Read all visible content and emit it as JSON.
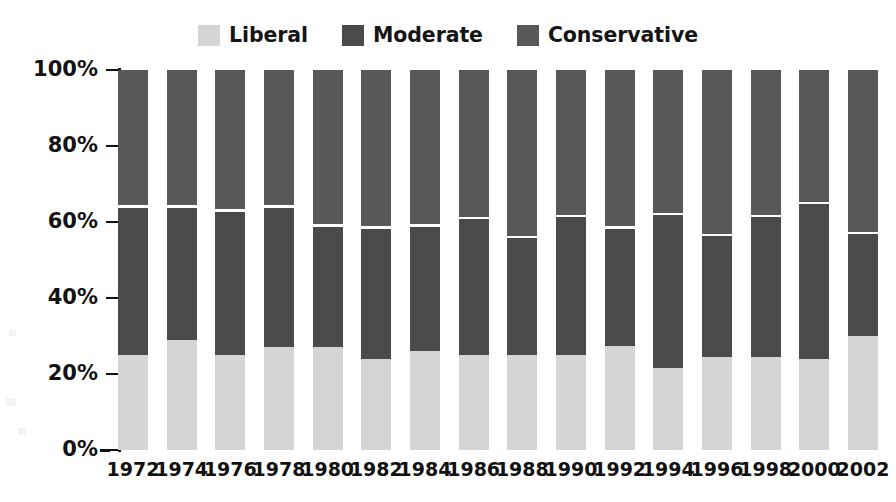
{
  "chart_data": {
    "type": "bar",
    "subtype": "stacked-100-percent",
    "title": "",
    "xlabel": "",
    "ylabel": "",
    "ylim": [
      0,
      100
    ],
    "ytick_labels": [
      "0%",
      "20%",
      "40%",
      "60%",
      "80%",
      "100%"
    ],
    "ytick_values": [
      0,
      20,
      40,
      60,
      80,
      100
    ],
    "grid": false,
    "legend_position": "top-center",
    "categories": [
      "1972",
      "1974",
      "1976",
      "1978",
      "1980",
      "1982",
      "1984",
      "1986",
      "1988",
      "1990",
      "1992",
      "1994",
      "1996",
      "1998",
      "2000",
      "2002"
    ],
    "series": [
      {
        "name": "Liberal",
        "color": "#d5d5d5",
        "values": [
          25,
          29,
          25,
          27,
          27,
          24,
          26,
          25,
          25,
          25,
          27.5,
          21.5,
          24.5,
          24.5,
          24,
          30
        ]
      },
      {
        "name": "Moderate",
        "color": "#4a4a4c",
        "values": [
          39,
          35,
          38,
          37,
          32,
          34.5,
          33,
          36,
          31,
          36.5,
          31,
          40.5,
          32,
          37,
          41,
          27
        ]
      },
      {
        "name": "Conservative",
        "color": "#58585a",
        "values": [
          36,
          36,
          37,
          36,
          41,
          41.5,
          41,
          39,
          44,
          38.5,
          41.5,
          38,
          43.5,
          38.5,
          35,
          43
        ]
      }
    ],
    "cumulative_tops": {
      "liberal_top_pct": [
        25,
        29,
        25,
        27,
        27,
        24,
        26,
        25,
        25,
        25,
        27.5,
        21.5,
        24.5,
        24.5,
        24,
        30
      ],
      "moderate_top_pct": [
        64,
        64,
        63,
        64,
        59,
        58.5,
        59,
        61,
        56,
        61.5,
        58.5,
        62,
        56.5,
        61.5,
        65,
        57
      ]
    }
  },
  "legend": {
    "items": [
      {
        "label": "Liberal",
        "color": "#d5d5d5",
        "icon": "legend-swatch-icon"
      },
      {
        "label": "Moderate",
        "color": "#4a4a4c",
        "icon": "legend-swatch-icon"
      },
      {
        "label": "Conservative",
        "color": "#58585a",
        "icon": "legend-swatch-icon"
      }
    ]
  },
  "axes": {
    "y": {
      "ticks": [
        {
          "label": "100%",
          "value": 100
        },
        {
          "label": "80%",
          "value": 80
        },
        {
          "label": "60%",
          "value": 60
        },
        {
          "label": "40%",
          "value": 40
        },
        {
          "label": "20%",
          "value": 20
        },
        {
          "label": "0%",
          "value": 0
        }
      ]
    },
    "x": {
      "ticks": [
        "1972",
        "1974",
        "1976",
        "1978",
        "1980",
        "1982",
        "1984",
        "1986",
        "1988",
        "1990",
        "1992",
        "1994",
        "1996",
        "1998",
        "2000",
        "2002"
      ]
    }
  }
}
